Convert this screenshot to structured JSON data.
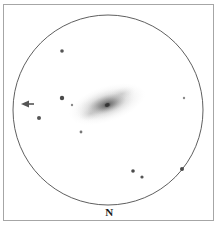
{
  "figure": {
    "kind": "eyepiece-field-sketch",
    "background_color": "#ffffff",
    "frame_color": "#a6a6a6",
    "ink_color": "#444444"
  },
  "orientation": {
    "label": "N",
    "position": "bottom-center"
  },
  "field_of_view": {
    "shape": "circle",
    "center_x": 108,
    "center_y": 110,
    "radius": 95,
    "stroke_color": "#4d4d4d",
    "stroke_width": 0.9
  },
  "galaxy": {
    "name": "galaxy",
    "center_x": 107,
    "center_y": 104,
    "halo_radius_x": 40,
    "halo_radius_y": 18,
    "tilt_degrees": -18,
    "core_radius_x": 13,
    "core_radius_y": 6,
    "nucleus_radius": 4,
    "halo_color": "#9a9a9a",
    "core_color": "#6a6a6a",
    "nucleus_color": "#3c3c3c"
  },
  "marker_arrow": {
    "name": "target-arrow",
    "tip_x": 21,
    "tip_y": 104,
    "tail_x": 34,
    "tail_y": 104,
    "color": "#555555",
    "points": "left"
  },
  "stars": [
    {
      "id": "s1",
      "x": 62,
      "y": 51,
      "r": 1.8,
      "color": "#555555"
    },
    {
      "id": "s2",
      "x": 62,
      "y": 98,
      "r": 2.2,
      "color": "#4a4a4a"
    },
    {
      "id": "s3",
      "x": 72,
      "y": 105,
      "r": 1.2,
      "color": "#8a8a8a"
    },
    {
      "id": "s4",
      "x": 39,
      "y": 118,
      "r": 2.0,
      "color": "#555555"
    },
    {
      "id": "s5",
      "x": 81,
      "y": 132,
      "r": 1.4,
      "color": "#777777"
    },
    {
      "id": "s6",
      "x": 184,
      "y": 98,
      "r": 1.2,
      "color": "#8a8a8a"
    },
    {
      "id": "s7",
      "x": 133,
      "y": 171,
      "r": 1.8,
      "color": "#4a4a4a"
    },
    {
      "id": "s8",
      "x": 142,
      "y": 177,
      "r": 1.6,
      "color": "#555555"
    },
    {
      "id": "s9",
      "x": 182,
      "y": 169,
      "r": 2.0,
      "color": "#4a4a4a"
    }
  ]
}
